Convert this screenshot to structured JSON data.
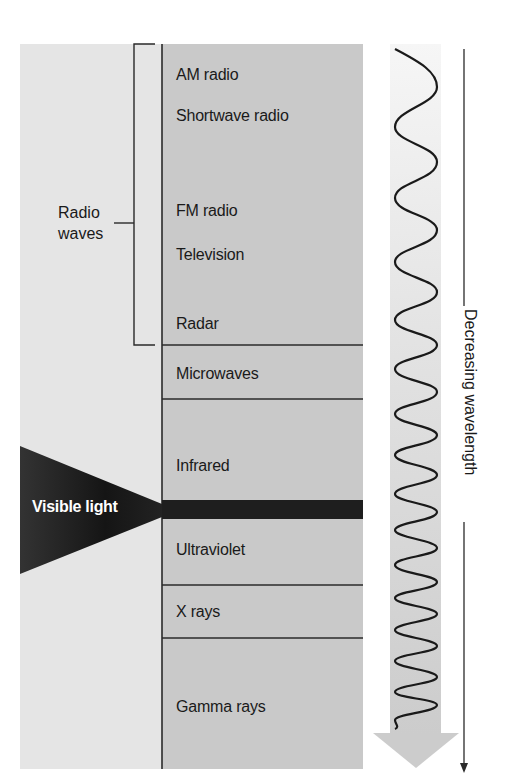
{
  "diagram": {
    "bands": [
      {
        "label": "AM radio",
        "y": 76
      },
      {
        "label": "Shortwave radio",
        "y": 123
      },
      {
        "label": "FM radio",
        "y": 218
      },
      {
        "label": "Television",
        "y": 262
      },
      {
        "label": "Radar",
        "y": 331
      },
      {
        "label": "Microwaves",
        "y": 381
      },
      {
        "label": "Infrared",
        "y": 473
      },
      {
        "label": "Ultraviolet",
        "y": 557
      },
      {
        "label": "X rays",
        "y": 619
      },
      {
        "label": "Gamma rays",
        "y": 714
      }
    ],
    "dividers_y": [
      345,
      399,
      585,
      638
    ],
    "radio_group": {
      "label_line1": "Radio",
      "label_line2": "waves"
    },
    "visible_light": {
      "label": "Visible light"
    },
    "axis": {
      "label": "Decreasing wavelength"
    },
    "colors": {
      "left_panel": "#e5e5e5",
      "right_panel": "#c9c9c9",
      "lines": "#2a2a2a",
      "visible_band": "#1e1e1e",
      "arrow": "#cfcfcf"
    }
  }
}
